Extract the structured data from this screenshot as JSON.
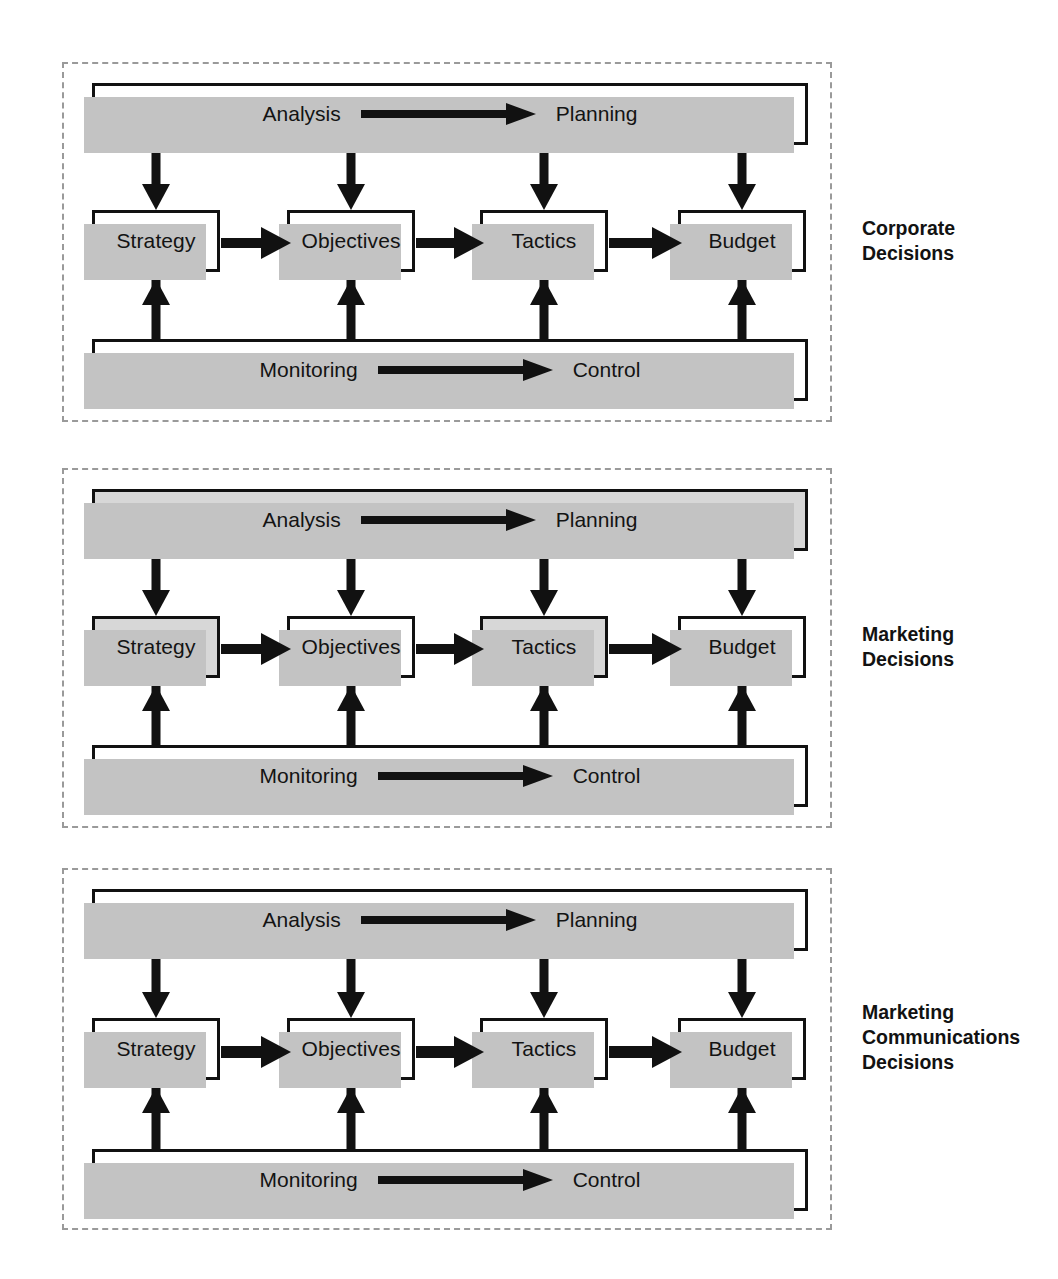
{
  "figure": {
    "type": "block-flow-diagram",
    "shading_colors": {
      "shaded_fill": "#d7d7d7",
      "plain_fill": "#ffffff",
      "drop_shadow": "#c3c3c3",
      "stroke": "#111111",
      "panel_border": "#9a9a9a"
    }
  },
  "common": {
    "top_bar": {
      "left_label": "Analysis",
      "right_label": "Planning"
    },
    "bottom_bar": {
      "left_label": "Monitoring",
      "right_label": "Control"
    },
    "stages": [
      "Strategy",
      "Objectives",
      "Tactics",
      "Budget"
    ]
  },
  "panels": [
    {
      "id": "corporate",
      "caption": "Corporate\nDecisions",
      "top_bar": {
        "left_label": "Analysis",
        "right_label": "Planning",
        "shaded": false
      },
      "bottom_bar": {
        "left_label": "Monitoring",
        "right_label": "Control",
        "shaded": false
      },
      "nodes": [
        {
          "label": "Strategy",
          "shaded": false
        },
        {
          "label": "Objectives",
          "shaded": false
        },
        {
          "label": "Tactics",
          "shaded": false
        },
        {
          "label": "Budget",
          "shaded": false
        }
      ]
    },
    {
      "id": "marketing",
      "caption": "Marketing\nDecisions",
      "top_bar": {
        "left_label": "Analysis",
        "right_label": "Planning",
        "shaded": true
      },
      "bottom_bar": {
        "left_label": "Monitoring",
        "right_label": "Control",
        "shaded": false
      },
      "nodes": [
        {
          "label": "Strategy",
          "shaded": true
        },
        {
          "label": "Objectives",
          "shaded": false
        },
        {
          "label": "Tactics",
          "shaded": true
        },
        {
          "label": "Budget",
          "shaded": false
        }
      ]
    },
    {
      "id": "marketing-communications",
      "caption": "Marketing\nCommunications\nDecisions",
      "top_bar": {
        "left_label": "Analysis",
        "right_label": "Planning",
        "shaded": false
      },
      "bottom_bar": {
        "left_label": "Monitoring",
        "right_label": "Control",
        "shaded": false
      },
      "nodes": [
        {
          "label": "Strategy",
          "shaded": false
        },
        {
          "label": "Objectives",
          "shaded": false
        },
        {
          "label": "Tactics",
          "shaded": false
        },
        {
          "label": "Budget",
          "shaded": false
        }
      ]
    }
  ]
}
